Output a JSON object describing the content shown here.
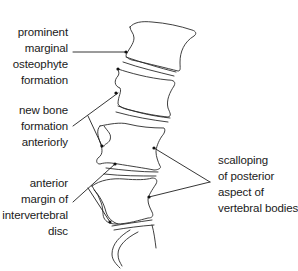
{
  "figure": {
    "colors": {
      "line": "#2a2a2a",
      "text": "#1a1a1a",
      "background": "#ffffff"
    }
  },
  "labels": {
    "osteophyte": {
      "lines": [
        "prominent",
        "marginal",
        "osteophyte",
        "formation"
      ]
    },
    "new_bone": {
      "lines": [
        "new bone",
        "formation",
        "anteriorly"
      ]
    },
    "anterior_margin": {
      "lines": [
        "anterior",
        "margin of",
        "intervertebral",
        "disc"
      ]
    },
    "scalloping": {
      "lines": [
        "scalloping",
        "of posterior",
        "aspect of",
        "vertebral bodies"
      ]
    }
  }
}
